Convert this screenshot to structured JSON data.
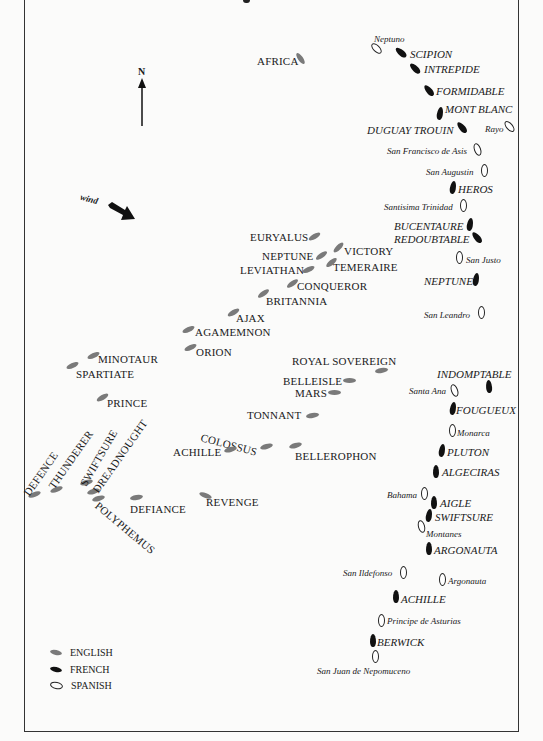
{
  "compass": {
    "label": "N"
  },
  "wind": {
    "label": "wind"
  },
  "legend": [
    {
      "key": "english",
      "label": "ENGLISH",
      "color": "#7a7a7a"
    },
    {
      "key": "french",
      "label": "FRENCH",
      "color": "#111111"
    },
    {
      "key": "spanish",
      "label": "SPANISH",
      "color": "#ffffff"
    }
  ],
  "ships": {
    "english": [
      {
        "name": "AFRICA"
      },
      {
        "name": "EURYALUS"
      },
      {
        "name": "NEPTUNE"
      },
      {
        "name": "VICTORY"
      },
      {
        "name": "LEVIATHAN"
      },
      {
        "name": "TEMERAIRE"
      },
      {
        "name": "CONQUEROR"
      },
      {
        "name": "BRITANNIA"
      },
      {
        "name": "AJAX"
      },
      {
        "name": "AGAMEMNON"
      },
      {
        "name": "ORION"
      },
      {
        "name": "MINOTAUR"
      },
      {
        "name": "SPARTIATE"
      },
      {
        "name": "PRINCE"
      },
      {
        "name": "ROYAL SOVEREIGN"
      },
      {
        "name": "BELLEISLE"
      },
      {
        "name": "MARS"
      },
      {
        "name": "TONNANT"
      },
      {
        "name": "COLOSSUS"
      },
      {
        "name": "ACHILLE"
      },
      {
        "name": "BELLEROPHON"
      },
      {
        "name": "DEFENCE"
      },
      {
        "name": "THUNDERER"
      },
      {
        "name": "SWIFTSURE"
      },
      {
        "name": "DREADNOUGHT"
      },
      {
        "name": "POLYPHEMUS"
      },
      {
        "name": "DEFIANCE"
      },
      {
        "name": "REVENGE"
      }
    ],
    "french": [
      {
        "name": "SCIPION"
      },
      {
        "name": "INTREPIDE"
      },
      {
        "name": "FORMIDABLE"
      },
      {
        "name": "MONT BLANC"
      },
      {
        "name": "DUGUAY TROUIN"
      },
      {
        "name": "HEROS"
      },
      {
        "name": "BUCENTAURE"
      },
      {
        "name": "REDOUBTABLE"
      },
      {
        "name": "NEPTUNE"
      },
      {
        "name": "INDOMPTABLE"
      },
      {
        "name": "FOUGUEUX"
      },
      {
        "name": "PLUTON"
      },
      {
        "name": "ALGECIRAS"
      },
      {
        "name": "AIGLE"
      },
      {
        "name": "SWIFTSURE"
      },
      {
        "name": "ARGONAUTA"
      },
      {
        "name": "ACHILLE"
      },
      {
        "name": "BERWICK"
      }
    ],
    "spanish": [
      {
        "name": "Neptuno"
      },
      {
        "name": "Rayo"
      },
      {
        "name": "San Francisco de Asis"
      },
      {
        "name": "San Augustin"
      },
      {
        "name": "Santisima Trinidad"
      },
      {
        "name": "San Justo"
      },
      {
        "name": "San Leandro"
      },
      {
        "name": "Santa Ana"
      },
      {
        "name": "Monarca"
      },
      {
        "name": "Bahama"
      },
      {
        "name": "Montanes"
      },
      {
        "name": "San Ildefonso"
      },
      {
        "name": "Argonauta"
      },
      {
        "name": "Principe de Asturias"
      },
      {
        "name": "San Juan de Nepomuceno"
      }
    ]
  }
}
